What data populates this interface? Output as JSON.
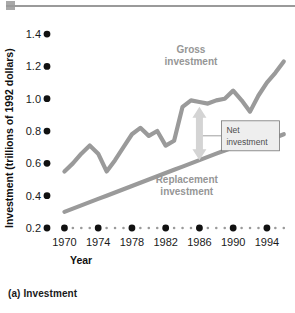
{
  "figure": {
    "caption": "(a) Investment",
    "decor": {
      "top_rule_color": "#9a9a9a",
      "top_block_color": "#a8a8a8"
    }
  },
  "chart_data": {
    "type": "line",
    "title": "",
    "subtitle": "",
    "xlabel": "Year",
    "ylabel": "Investment (trillions of 1992 dollars)",
    "xlim": [
      1969,
      1996.5
    ],
    "ylim": [
      0.2,
      1.45
    ],
    "grid": false,
    "legend_position": "inline-annotations",
    "y_ticks": [
      0.2,
      0.4,
      0.6,
      0.8,
      1.0,
      1.2,
      1.4
    ],
    "y_tick_labels": [
      "0.2",
      "0.4",
      "0.6",
      "0.8",
      "1.0",
      "1.2",
      "1.4"
    ],
    "x_ticks": [
      1970,
      1974,
      1978,
      1982,
      1986,
      1990,
      1994
    ],
    "x_tick_labels": [
      "1970",
      "1974",
      "1978",
      "1982",
      "1986",
      "1990",
      "1994"
    ],
    "x_minor_ticks": [
      1971,
      1972,
      1973,
      1975,
      1976,
      1977,
      1979,
      1980,
      1981,
      1983,
      1984,
      1985,
      1987,
      1988,
      1989,
      1991,
      1992,
      1993,
      1995,
      1996
    ],
    "x": [
      1970,
      1971,
      1972,
      1973,
      1974,
      1975,
      1976,
      1977,
      1978,
      1979,
      1980,
      1981,
      1982,
      1983,
      1984,
      1985,
      1986,
      1987,
      1988,
      1989,
      1990,
      1991,
      1992,
      1993,
      1994,
      1995,
      1996
    ],
    "series": [
      {
        "name": "Gross investment",
        "color": "#9a9a9a",
        "label_x": 1985.0,
        "label_y": 1.28,
        "values": [
          0.55,
          0.6,
          0.66,
          0.71,
          0.66,
          0.55,
          0.62,
          0.7,
          0.78,
          0.82,
          0.77,
          0.8,
          0.71,
          0.74,
          0.95,
          0.99,
          0.98,
          0.97,
          0.99,
          1.0,
          1.05,
          0.99,
          0.92,
          1.02,
          1.1,
          1.16,
          1.23
        ]
      },
      {
        "name": "Replacement investment",
        "color": "#9a9a9a",
        "label_x": 1984.5,
        "label_y": 0.48,
        "values": [
          0.3,
          0.32,
          0.34,
          0.36,
          0.38,
          0.4,
          0.42,
          0.44,
          0.46,
          0.48,
          0.5,
          0.52,
          0.54,
          0.56,
          0.58,
          0.6,
          0.62,
          0.64,
          0.66,
          0.68,
          0.7,
          0.72,
          0.73,
          0.74,
          0.77,
          0.76,
          0.78
        ]
      }
    ],
    "annotations": [
      {
        "name": "net-investment",
        "label_line1": "Net",
        "label_line2": "investment",
        "arrow_x": 1986.0,
        "arrow_top": 0.95,
        "arrow_bottom": 0.62,
        "arrow_color": "#d4d4d4",
        "box_fill": "#eeeeee",
        "box_stroke": "#777777"
      }
    ]
  }
}
